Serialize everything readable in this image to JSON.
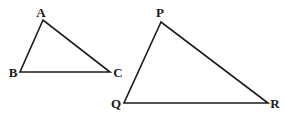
{
  "diagram": {
    "type": "geometry-triangles",
    "colors": {
      "stroke": "#1a1a1a",
      "background": "#ffffff"
    },
    "triangles": [
      {
        "name": "ABC",
        "vertices": [
          {
            "label": "A",
            "x": 43,
            "y": 20,
            "label_x": 41,
            "label_y": 17,
            "anchor": "middle"
          },
          {
            "label": "B",
            "x": 20,
            "y": 72,
            "label_x": 13,
            "label_y": 77,
            "anchor": "middle"
          },
          {
            "label": "C",
            "x": 110,
            "y": 72,
            "label_x": 118,
            "label_y": 77,
            "anchor": "middle"
          }
        ]
      },
      {
        "name": "PQR",
        "vertices": [
          {
            "label": "P",
            "x": 161,
            "y": 22,
            "label_x": 160,
            "label_y": 17,
            "anchor": "middle"
          },
          {
            "label": "Q",
            "x": 124,
            "y": 103,
            "label_x": 116,
            "label_y": 108,
            "anchor": "middle"
          },
          {
            "label": "R",
            "x": 268,
            "y": 103,
            "label_x": 275,
            "label_y": 108,
            "anchor": "middle"
          }
        ]
      }
    ]
  }
}
